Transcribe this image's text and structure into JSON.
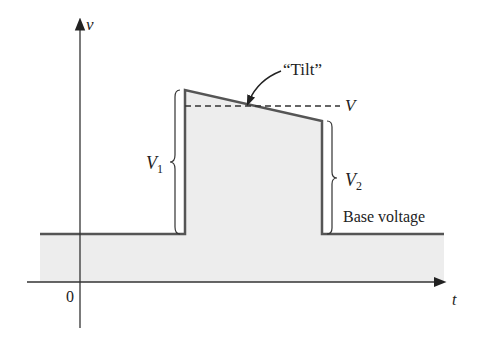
{
  "diagram": {
    "type": "pulse-waveform-tilt",
    "axes": {
      "y_label": "v",
      "x_label": "t",
      "origin_label": "0"
    },
    "labels": {
      "tilt": "“Tilt”",
      "v_avg": "V",
      "v1": "V",
      "v1_sub": "1",
      "v2": "V",
      "v2_sub": "2",
      "base": "Base voltage"
    },
    "colors": {
      "line": "#555555",
      "axis": "#333333",
      "fill": "#ededed",
      "text": "#222222"
    }
  }
}
